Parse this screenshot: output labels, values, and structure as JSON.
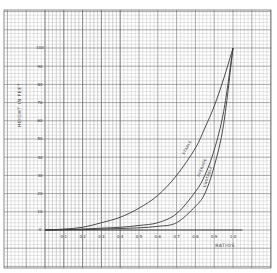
{
  "chart_data": {
    "type": "line",
    "title": "",
    "xlabel": "RATIOS",
    "ylabel": "HEIGHT IN FEET",
    "xlim": [
      0,
      1.0
    ],
    "ylim": [
      0,
      100
    ],
    "grid": true,
    "legend": "inline labels along curves",
    "x_ticks": [
      "0.1",
      "0.2",
      "0.3",
      "0.4",
      "0.5",
      "0.6",
      "0.7",
      "0.8",
      "0.9",
      "1.0"
    ],
    "y_ticks": [
      "0",
      "10",
      "20",
      "30",
      "40",
      "50",
      "60",
      "70",
      "80",
      "90",
      "100"
    ],
    "x": [
      0.0,
      0.1,
      0.2,
      0.3,
      0.4,
      0.5,
      0.6,
      0.7,
      0.8,
      0.85,
      0.9,
      0.95,
      1.0
    ],
    "series": [
      {
        "name": "STABLE",
        "values": [
          0,
          0.5,
          1.5,
          4,
          7,
          12,
          19,
          30,
          45,
          56,
          68,
          83,
          100
        ]
      },
      {
        "name": "AVERAGE",
        "values": [
          0,
          0.2,
          0.5,
          1,
          1.5,
          2.5,
          4,
          9,
          21,
          30,
          44,
          65,
          100
        ]
      },
      {
        "name": "UNSTABLE",
        "values": [
          0,
          0.1,
          0.2,
          0.5,
          0.8,
          1.2,
          2,
          4,
          13,
          20,
          35,
          58,
          100
        ]
      }
    ]
  },
  "colors": {
    "paper": "#ffffff",
    "minor_grid": "#b5b5b5",
    "major_grid": "#6e6e6e",
    "curve": "#3a3a3a",
    "text": "#333333"
  }
}
